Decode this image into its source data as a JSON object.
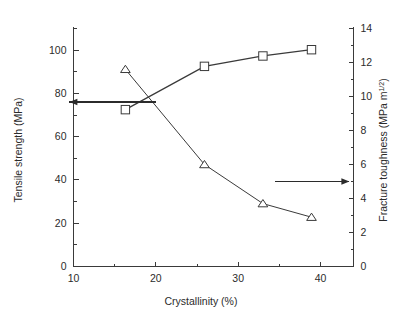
{
  "chart_data": {
    "type": "line",
    "title": "",
    "xlabel": "Crystallinity (%)",
    "ylabel": "Tensile strength (MPa)",
    "y2label_main": "Fracture toughness (MPa m",
    "y2label_sup": "1/2",
    "y2label_tail": ")",
    "xlim": [
      10,
      44
    ],
    "ylim": [
      0,
      110
    ],
    "y2lim": [
      0,
      14
    ],
    "xticks": [
      10,
      20,
      30,
      40
    ],
    "xticklabels": [
      "10",
      "20",
      "30",
      "40"
    ],
    "xminorticks": [
      15,
      25,
      35
    ],
    "yticks": [
      0,
      20,
      40,
      60,
      80,
      100
    ],
    "yticklabels": [
      "0",
      "20",
      "40",
      "60",
      "80",
      "100"
    ],
    "yminorticks": [
      10,
      30,
      50,
      70,
      90,
      110
    ],
    "y2ticks": [
      0,
      2,
      4,
      6,
      8,
      10,
      12,
      14
    ],
    "y2ticklabels": [
      "0",
      "2",
      "4",
      "6",
      "8",
      "10",
      "12",
      "14"
    ],
    "y2minorticks": [
      1,
      3,
      5,
      7,
      9,
      11,
      13
    ],
    "grid": false,
    "legend": "none",
    "line_color": "#3a3a3a",
    "marker_face_color": "#ffffff",
    "series": [
      {
        "name": "Tensile strength",
        "axis": "left",
        "marker": "square",
        "x": [
          16.3,
          25.9,
          33.0,
          38.9
        ],
        "values": [
          72.5,
          92.5,
          97.3,
          100.2
        ]
      },
      {
        "name": "Fracture toughness",
        "axis": "right",
        "marker": "triangle",
        "x": [
          16.3,
          25.9,
          33.0,
          38.9
        ],
        "values": [
          11.6,
          6.0,
          3.7,
          2.9
        ]
      }
    ],
    "annotations": [
      {
        "name": "left-axis-arrow",
        "description": "arrow pointing left toward tensile strength axis",
        "direction": "left",
        "x_start": 20.0,
        "x_end": 9.5,
        "y_left_axis": 76.0
      },
      {
        "name": "right-axis-arrow",
        "description": "arrow pointing right toward fracture toughness axis",
        "direction": "right",
        "x_start": 34.5,
        "x_end": 43.5,
        "y_right_axis": 5.0
      }
    ]
  }
}
